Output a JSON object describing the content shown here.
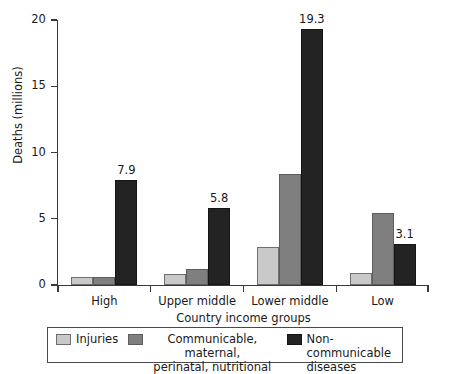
{
  "chart_data": {
    "type": "bar",
    "title": "",
    "xlabel": "Country income groups",
    "ylabel": "Deaths (millions)",
    "categories": [
      "High",
      "Upper middle",
      "Lower middle",
      "Low"
    ],
    "series": [
      {
        "name": "Injuries",
        "color": "#c9c9c9",
        "values": [
          0.6,
          0.8,
          2.9,
          0.9
        ]
      },
      {
        "name": "Communicable, maternal, perinatal, nutritional",
        "color": "#7f7f7f",
        "values": [
          0.6,
          1.2,
          8.4,
          5.4
        ]
      },
      {
        "name": "Non-communicable diseases",
        "color": "#232323",
        "values": [
          7.9,
          5.8,
          19.3,
          3.1
        ]
      }
    ],
    "value_labels": [
      {
        "category": "High",
        "series": "Non-communicable diseases",
        "text": "7.9"
      },
      {
        "category": "Upper middle",
        "series": "Non-communicable diseases",
        "text": "5.8"
      },
      {
        "category": "Lower middle",
        "series": "Non-communicable diseases",
        "text": "19.3"
      },
      {
        "category": "Low",
        "series": "Non-communicable diseases",
        "text": "3.1"
      }
    ],
    "ylim": [
      0,
      20
    ],
    "yticks": [
      0,
      5,
      10,
      15,
      20
    ],
    "ytick_labels": [
      "0",
      "5",
      "10",
      "15",
      "20"
    ],
    "grid": false,
    "legend_position": "bottom"
  },
  "legend": {
    "items": [
      {
        "label": "Injuries"
      },
      {
        "label_line1": "Communicable, maternal,",
        "label_line2": "perinatal, nutritional"
      },
      {
        "label_line1": "Non-communicable",
        "label_line2": "diseases"
      }
    ]
  }
}
